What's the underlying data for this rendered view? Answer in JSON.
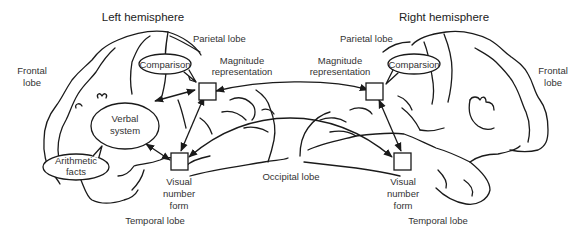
{
  "diagram": {
    "left": {
      "title": "Left hemisphere",
      "parietal": "Parietal lobe",
      "frontal_1": "Frontal",
      "frontal_2": "lobe",
      "comparison": "Comparison",
      "magnitude_1": "Magnitude",
      "magnitude_2": "representation",
      "verbal_1": "Verbal",
      "verbal_2": "system",
      "arith_1": "Arithmetic",
      "arith_2": "facts",
      "vnf_1": "Visual",
      "vnf_2": "number",
      "vnf_3": "form",
      "temporal": "Temporal lobe"
    },
    "right": {
      "title": "Right hemisphere",
      "parietal": "Parietal lobe",
      "frontal_1": "Frontal",
      "frontal_2": "lobe",
      "comparison": "Comparsion",
      "magnitude_1": "Magnitude",
      "magnitude_2": "representation",
      "vnf_1": "Visual",
      "vnf_2": "number",
      "vnf_3": "form",
      "temporal": "Temporal lobe"
    },
    "center": {
      "occipital": "Occipital lobe"
    },
    "connections": [
      {
        "from": "Verbal system",
        "to": "Magnitude representation (L)",
        "bidirectional": true
      },
      {
        "from": "Verbal system",
        "to": "Visual number form (L)",
        "bidirectional": true
      },
      {
        "from": "Magnitude representation (L)",
        "to": "Visual number form (L)",
        "bidirectional": true
      },
      {
        "from": "Magnitude representation (R)",
        "to": "Visual number form (R)",
        "bidirectional": true
      },
      {
        "from": "Magnitude representation (L)",
        "to": "Magnitude representation (R)",
        "bidirectional": true
      },
      {
        "from": "Visual number form (L)",
        "to": "Visual number form (R)",
        "bidirectional": true
      }
    ],
    "colors": {
      "line": "#1a1a1a",
      "text": "#333333",
      "background": "#ffffff"
    }
  }
}
